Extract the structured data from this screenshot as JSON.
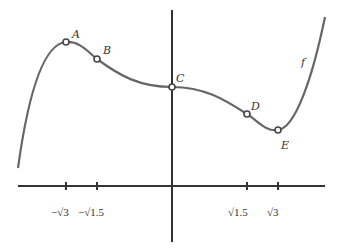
{
  "function_label": "f",
  "points": [
    {
      "name": "A",
      "x": 66,
      "y": 42,
      "lx": 72,
      "ly": 38
    },
    {
      "name": "B",
      "x": 97,
      "y": 59,
      "lx": 103,
      "ly": 54
    },
    {
      "name": "C",
      "x": 172,
      "y": 87,
      "lx": 177,
      "ly": 82
    },
    {
      "name": "D",
      "x": 247,
      "y": 114,
      "lx": 252,
      "ly": 109
    },
    {
      "name": "E",
      "x": 278,
      "y": 130,
      "lx": 281,
      "ly": 148
    }
  ],
  "x_ticks": [
    {
      "label": "−√3",
      "x": 66
    },
    {
      "label": "−√1.5",
      "x": 97
    },
    {
      "label": "√1.5",
      "x": 247
    },
    {
      "label": "√3",
      "x": 278
    }
  ],
  "colors": {
    "axis": "#333333",
    "curve": "#666666",
    "point_fill": "#ffffff"
  }
}
